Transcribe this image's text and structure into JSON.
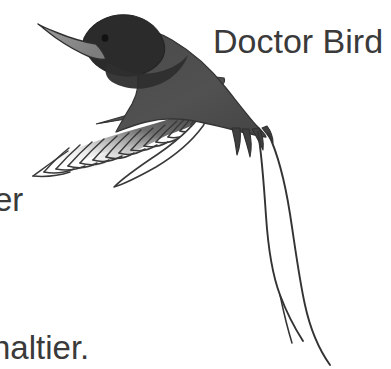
{
  "page": {
    "background_color": "#ffffff",
    "width": 391,
    "height": 369
  },
  "illustration": {
    "name": "doctor-bird-illustration",
    "subject": "Doctor Bird (red-billed streamertail hummingbird) in flight",
    "colors": {
      "head": "#2b2b2b",
      "body": "#4e4e4e",
      "beak": "#8a8a8a",
      "beak_outline": "#2f2f2f",
      "wing_upper": "#555555",
      "wing_lower": "#ffffff",
      "outline": "#2f2f2f",
      "collar_stripe": "#ffffff",
      "eye": "#141414",
      "streamer": "#333333"
    }
  },
  "captions": {
    "title": "Doctor Bird",
    "left_fragment": "er",
    "bottom_fragment": "naltier.",
    "text_color": "#3a3a3a"
  }
}
